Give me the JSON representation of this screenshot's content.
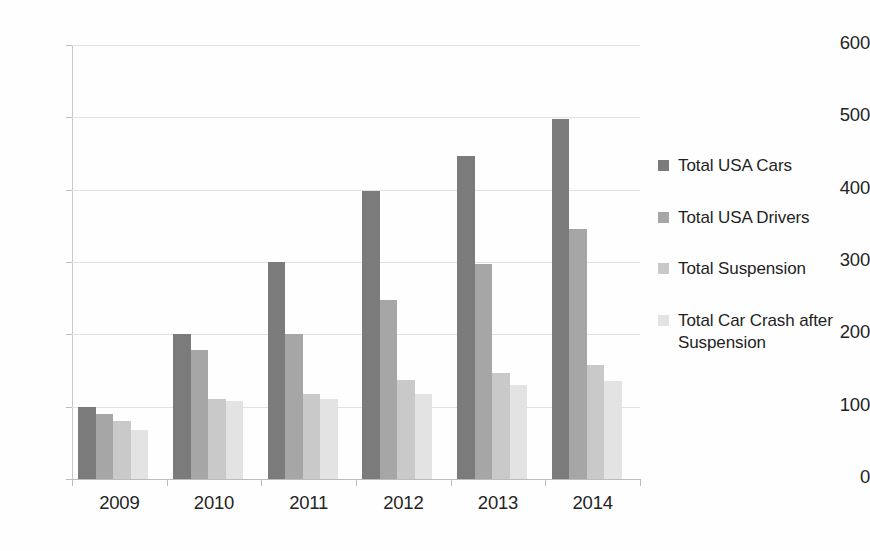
{
  "chart_data": {
    "type": "bar",
    "title": "",
    "subtitle": "",
    "xlabel": "",
    "ylabel": "",
    "categories": [
      "2009",
      "2010",
      "2011",
      "2012",
      "2013",
      "2014"
    ],
    "ylim": [
      0,
      600
    ],
    "y_ticks": [
      0,
      100,
      200,
      300,
      400,
      500,
      600
    ],
    "y_tick_labels": [
      "0",
      "100",
      "200",
      "300",
      "400",
      "500",
      "600"
    ],
    "grid": true,
    "grid_axis": "y",
    "legend_position": "right",
    "series": [
      {
        "name": "Total USA Cars",
        "color": "#7b7b7b",
        "values": [
          100,
          200,
          300,
          398,
          447,
          498
        ]
      },
      {
        "name": "Total USA Drivers",
        "color": "#a6a6a6",
        "values": [
          90,
          178,
          200,
          248,
          297,
          345
        ]
      },
      {
        "name": "Total Suspension",
        "color": "#c9c9c9",
        "values": [
          80,
          110,
          118,
          137,
          147,
          157
        ]
      },
      {
        "name": "Total Car Crash after Suspension",
        "color": "#e3e3e3",
        "values": [
          68,
          108,
          110,
          118,
          130,
          135
        ]
      }
    ],
    "colors": {
      "background": "#fefefe",
      "gridline": "#dfe2e6",
      "axis": "#b9bdc2",
      "text": "#242424"
    }
  }
}
